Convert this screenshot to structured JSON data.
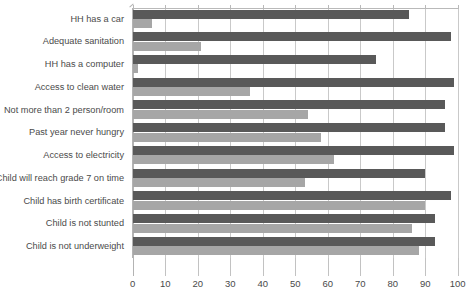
{
  "chart_data": {
    "type": "bar",
    "orientation": "horizontal",
    "title": "",
    "subtitle": "",
    "xlabel": "",
    "ylabel": "",
    "xlim": [
      0,
      100
    ],
    "xticks": [
      0,
      10,
      20,
      30,
      40,
      50,
      60,
      70,
      80,
      90,
      100
    ],
    "xticklabels": [
      "0",
      "10",
      "20",
      "30",
      "40",
      "50",
      "60",
      "70",
      "80",
      "90",
      "100"
    ],
    "grid": true,
    "legend": false,
    "legend_position": "none",
    "categories": [
      "HH has a car",
      "Adequate sanitation",
      "HH has a computer",
      "Access to clean water",
      "Not more than 2 person/room",
      "Past year never hungry",
      "Access to electricity",
      "Child will reach grade 7 on time",
      "Child has birth certificate",
      "Child is not stunted",
      "Child is not underweight"
    ],
    "series": [
      {
        "name": "dark",
        "color": "#595959",
        "values": [
          85,
          98,
          75,
          99,
          96,
          96,
          99,
          90,
          98,
          93,
          93
        ]
      },
      {
        "name": "light",
        "color": "#a6a6a6",
        "values": [
          6,
          21,
          1.5,
          36,
          54,
          58,
          62,
          53,
          90,
          86,
          88
        ]
      }
    ],
    "colors": {
      "dark_bar": "#595959",
      "light_bar": "#a6a6a6",
      "gridline": "#c9c9c9",
      "axis": "#b3b3b3",
      "text": "#4a4a4a",
      "background": "#ffffff"
    }
  }
}
